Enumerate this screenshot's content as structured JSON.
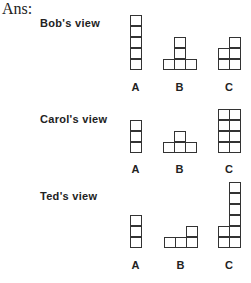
{
  "answer_label": "Ans:",
  "views": [
    {
      "title": "Bob's view",
      "title_pos": [
        40,
        17
      ],
      "baseline": 70,
      "label_y": 81,
      "figures": [
        {
          "label": "A",
          "x": 130,
          "columns": [
            5
          ]
        },
        {
          "label": "B",
          "x": 163,
          "columns": [
            1,
            3,
            1
          ]
        },
        {
          "label": "C",
          "x": 218,
          "columns": [
            2,
            3
          ]
        }
      ]
    },
    {
      "title": "Carol's view",
      "title_pos": [
        40,
        113
      ],
      "baseline": 153,
      "label_y": 163,
      "figures": [
        {
          "label": "A",
          "x": 130,
          "columns": [
            3
          ]
        },
        {
          "label": "B",
          "x": 163,
          "columns": [
            1,
            2,
            1
          ]
        },
        {
          "label": "C",
          "x": 218,
          "columns": [
            4,
            4
          ]
        }
      ]
    },
    {
      "title": "Ted's view",
      "title_pos": [
        40,
        190
      ],
      "baseline": 248,
      "label_y": 259,
      "figures": [
        {
          "label": "A",
          "x": 130,
          "columns": [
            3
          ]
        },
        {
          "label": "B",
          "x": 164,
          "columns": [
            1,
            1,
            2
          ]
        },
        {
          "label": "C",
          "x": 218,
          "columns": [
            2,
            6
          ]
        }
      ]
    }
  ]
}
